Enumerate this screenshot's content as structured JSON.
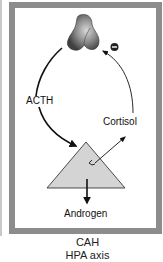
{
  "diagram": {
    "nodes": {
      "pituitary": {
        "label": "",
        "icon": "pituitary-gland-icon"
      },
      "adrenal": {
        "label": "",
        "icon": "adrenal-triangle-icon"
      }
    },
    "labels": {
      "acth": "ACTH",
      "cortisol": "Cortisol",
      "androgen": "Androgen"
    },
    "symbols": {
      "negative_feedback": "negative-feedback-icon",
      "enzyme_block": "enzyme-block-icon"
    },
    "edges": [
      {
        "from": "pituitary",
        "to": "adrenal",
        "label": "ACTH",
        "style": "thick"
      },
      {
        "from": "adrenal",
        "to": "cortisol",
        "label": "Cortisol",
        "style": "thin"
      },
      {
        "from": "cortisol",
        "to": "pituitary",
        "label": "",
        "style": "thin",
        "effect": "negative"
      },
      {
        "from": "adrenal",
        "to": "androgen",
        "label": "Androgen",
        "style": "thick"
      }
    ],
    "caption": {
      "line1": "CAH",
      "line2": "HPA axis"
    },
    "colors": {
      "frame": "#8c8c8c",
      "triangle_fill": "#d4d4d4",
      "gland_dark": "#555555",
      "gland_light": "#bdbdbd",
      "stroke": "#111111"
    }
  }
}
